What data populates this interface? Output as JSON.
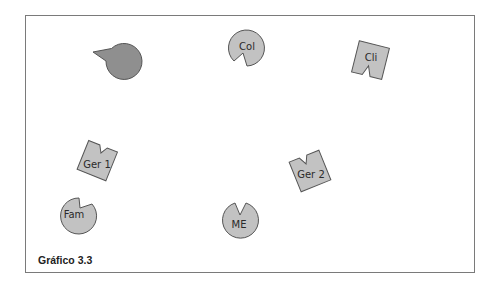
{
  "caption": "Gráfico 3.3",
  "colors": {
    "border": "#7a7a7a",
    "shape_fill_light": "#c2c2c2",
    "shape_fill_dark": "#8f8f8f",
    "shape_stroke": "#555555",
    "text": "#2a2a2a"
  },
  "shapes": [
    {
      "id": "unlabeled",
      "label": "",
      "kind": "notched-circle",
      "shade": "dark"
    },
    {
      "id": "col",
      "label": "Col",
      "kind": "notched-circle",
      "shade": "light"
    },
    {
      "id": "cli",
      "label": "Cli",
      "kind": "notched-square",
      "shade": "light"
    },
    {
      "id": "ger1",
      "label": "Ger 1",
      "kind": "notched-square",
      "shade": "light"
    },
    {
      "id": "ger2",
      "label": "Ger 2",
      "kind": "notched-square",
      "shade": "light"
    },
    {
      "id": "fam",
      "label": "Fam",
      "kind": "notched-circle",
      "shade": "light"
    },
    {
      "id": "me",
      "label": "ME",
      "kind": "notched-circle",
      "shade": "light"
    }
  ]
}
